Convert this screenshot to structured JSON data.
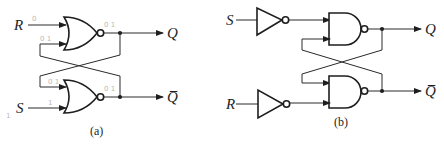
{
  "diagram_a": {
    "caption": "(a)",
    "gate_type": "NOR",
    "inputs": {
      "top": "R",
      "bottom": "S"
    },
    "outputs": {
      "top": "Q",
      "bottom": "Q̅"
    },
    "pencil_annotations": [
      "0",
      "0 1",
      "0 1",
      "0 1",
      "0 1",
      "1",
      "1"
    ]
  },
  "diagram_b": {
    "caption": "(b)",
    "gate_type": "NAND",
    "inverter_inputs": {
      "top": "S",
      "bottom": "R"
    },
    "outputs": {
      "top": "Q",
      "bottom": "Q̅"
    }
  },
  "colors": {
    "ink": "#1e1e1e",
    "pencil": "#b8b8b8",
    "background": "#ffffff"
  }
}
